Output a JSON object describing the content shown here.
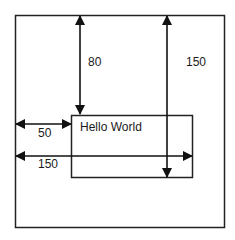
{
  "diagram": {
    "title": "",
    "outer_box": {
      "label": "container"
    },
    "inner_box": {
      "text": "Hello World"
    },
    "dimensions": {
      "top_offset": "80",
      "left_offset": "50",
      "height": "150",
      "width": "150"
    },
    "colors": {
      "stroke": "#1a1a1a",
      "background": "#ffffff"
    }
  }
}
